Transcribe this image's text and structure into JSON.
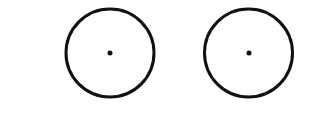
{
  "diagram": {
    "background": "#ffffff",
    "stroke_color": "#111111",
    "stroke_width": 3,
    "shapes": [
      {
        "type": "circle",
        "cx": 110,
        "cy": 53,
        "r": 44,
        "center_dot": {
          "cx": 110,
          "cy": 53,
          "r": 2.5
        }
      },
      {
        "type": "circle",
        "cx": 248.5,
        "cy": 53,
        "r": 44,
        "center_dot": {
          "cx": 249,
          "cy": 53,
          "r": 2.5
        }
      }
    ]
  }
}
